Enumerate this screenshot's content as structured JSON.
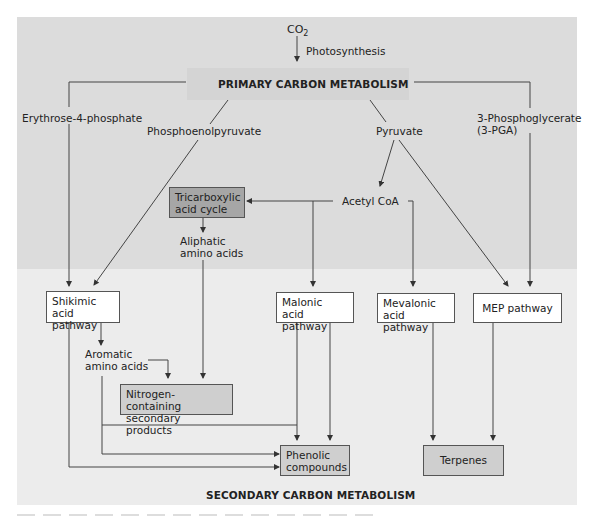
{
  "diagram": {
    "input": {
      "co2": "CO",
      "co2_sub": "2",
      "process": "Photosynthesis"
    },
    "headers": {
      "primary": "PRIMARY CARBON METABOLISM",
      "secondary": "SECONDARY CARBON METABOLISM"
    },
    "intermediates": {
      "erythrose": "Erythrose-4-phosphate",
      "pep": "Phosphoenolpyruvate",
      "pyruvate": "Pyruvate",
      "pga_line1": "3-Phosphoglycerate",
      "pga_line2": "(3-PGA)",
      "acetyl_coa": "Acetyl CoA",
      "aliphatic_line1": "Aliphatic",
      "aliphatic_line2": "amino acids",
      "aromatic_line1": "Aromatic",
      "aromatic_line2": "amino acids"
    },
    "boxes": {
      "tca_line1": "Tricarboxylic",
      "tca_line2": "acid cycle",
      "shikimic_line1": "Shikimic acid",
      "shikimic_line2": "pathway",
      "malonic_line1": "Malonic",
      "malonic_line2": "acid pathway",
      "mevalonic_line1": "Mevalonic",
      "mevalonic_line2": "acid pathway",
      "mep": "MEP pathway",
      "nitrogen_line1": "Nitrogen-containing",
      "nitrogen_line2": "secondary products",
      "phenolic_line1": "Phenolic",
      "phenolic_line2": "compounds",
      "terpenes": "Terpenes"
    },
    "colors": {
      "primary_bg": "#dcdcdc",
      "secondary_bg": "#ececec",
      "tca_box": "#a6a6a6",
      "product_box": "#cfcfcf",
      "pathway_box": "#ffffff",
      "line": "#444444"
    }
  }
}
